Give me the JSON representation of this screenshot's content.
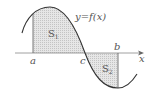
{
  "diagram": {
    "type": "function-area-graph",
    "curve_label": "y=f(x)",
    "axis_label": "x",
    "points": {
      "a": "a",
      "b": "b",
      "c": "c"
    },
    "regions": [
      {
        "id": "S1",
        "label": "S",
        "sub": "1",
        "position": "above-axis",
        "from": "a",
        "to": "c"
      },
      {
        "id": "S2",
        "label": "S",
        "sub": "2",
        "position": "below-axis",
        "from": "c",
        "to": "b"
      }
    ],
    "colors": {
      "curve": "#333333",
      "axis": "#777777",
      "shade": "#d9d9d9",
      "text": "#555555"
    }
  }
}
